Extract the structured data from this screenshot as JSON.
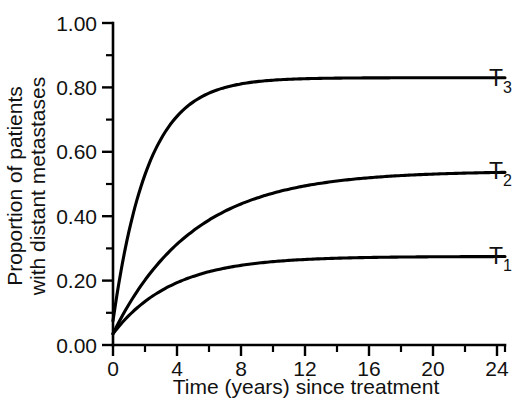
{
  "chart_data": {
    "type": "line",
    "title": "",
    "xlabel": "Time (years) since treatment",
    "ylabel_line1": "Proportion of patients",
    "ylabel_line2": "with distant metastases",
    "xlim": [
      0,
      24.5
    ],
    "ylim": [
      0,
      1.0
    ],
    "grid": false,
    "legend_position": "right-inline",
    "x_major_ticks": [
      0,
      4,
      8,
      12,
      16,
      20,
      24
    ],
    "x_major_tick_labels": [
      "0",
      "4",
      "8",
      "12",
      "16",
      "20",
      "24"
    ],
    "x_minor_ticks": [
      2,
      6,
      10,
      14,
      18,
      22
    ],
    "y_major_ticks": [
      0.0,
      0.2,
      0.4,
      0.6,
      0.8,
      1.0
    ],
    "y_major_tick_labels": [
      "0.00",
      "0.20",
      "0.40",
      "0.60",
      "0.80",
      "1.00"
    ],
    "y_minor_ticks": [
      0.1,
      0.3,
      0.5,
      0.7,
      0.9
    ],
    "series": [
      {
        "name": "T3",
        "label_base": "T",
        "label_sub": "3",
        "y0": 0.075,
        "plateau": 0.83,
        "rate": 0.46,
        "label_y": 0.83,
        "values": [
          {
            "x": 0,
            "y": 0.075
          },
          {
            "x": 0.5,
            "y": 0.23
          },
          {
            "x": 1,
            "y": 0.36
          },
          {
            "x": 1.5,
            "y": 0.46
          },
          {
            "x": 2,
            "y": 0.54
          },
          {
            "x": 2.5,
            "y": 0.6
          },
          {
            "x": 3,
            "y": 0.65
          },
          {
            "x": 4,
            "y": 0.715
          },
          {
            "x": 5,
            "y": 0.757
          },
          {
            "x": 6,
            "y": 0.784
          },
          {
            "x": 8,
            "y": 0.811
          },
          {
            "x": 10,
            "y": 0.822
          },
          {
            "x": 12,
            "y": 0.827
          },
          {
            "x": 16,
            "y": 0.83
          },
          {
            "x": 20,
            "y": 0.83
          },
          {
            "x": 24,
            "y": 0.83
          }
        ]
      },
      {
        "name": "T2",
        "label_base": "T",
        "label_sub": "2",
        "y0": 0.035,
        "plateau": 0.54,
        "rate": 0.2,
        "label_y": 0.54,
        "values": [
          {
            "x": 0,
            "y": 0.035
          },
          {
            "x": 1,
            "y": 0.126
          },
          {
            "x": 2,
            "y": 0.204
          },
          {
            "x": 3,
            "y": 0.266
          },
          {
            "x": 4,
            "y": 0.32
          },
          {
            "x": 5,
            "y": 0.364
          },
          {
            "x": 6,
            "y": 0.4
          },
          {
            "x": 8,
            "y": 0.456
          },
          {
            "x": 10,
            "y": 0.49
          },
          {
            "x": 12,
            "y": 0.511
          },
          {
            "x": 14,
            "y": 0.523
          },
          {
            "x": 16,
            "y": 0.53
          },
          {
            "x": 20,
            "y": 0.537
          },
          {
            "x": 24,
            "y": 0.54
          }
        ]
      },
      {
        "name": "T1",
        "label_base": "T",
        "label_sub": "1",
        "y0": 0.035,
        "plateau": 0.275,
        "rate": 0.27,
        "label_y": 0.275,
        "values": [
          {
            "x": 0,
            "y": 0.035
          },
          {
            "x": 1,
            "y": 0.063
          },
          {
            "x": 2,
            "y": 0.09
          },
          {
            "x": 3,
            "y": 0.116
          },
          {
            "x": 4,
            "y": 0.14
          },
          {
            "x": 5,
            "y": 0.163
          },
          {
            "x": 6,
            "y": 0.185
          },
          {
            "x": 7,
            "y": 0.21
          },
          {
            "x": 8,
            "y": 0.238
          },
          {
            "x": 9,
            "y": 0.262
          },
          {
            "x": 10,
            "y": 0.27
          },
          {
            "x": 12,
            "y": 0.272
          },
          {
            "x": 16,
            "y": 0.273
          },
          {
            "x": 20,
            "y": 0.274
          },
          {
            "x": 24,
            "y": 0.275
          }
        ]
      }
    ]
  },
  "colors": {
    "background": "#ffffff",
    "ink": "#000000"
  }
}
